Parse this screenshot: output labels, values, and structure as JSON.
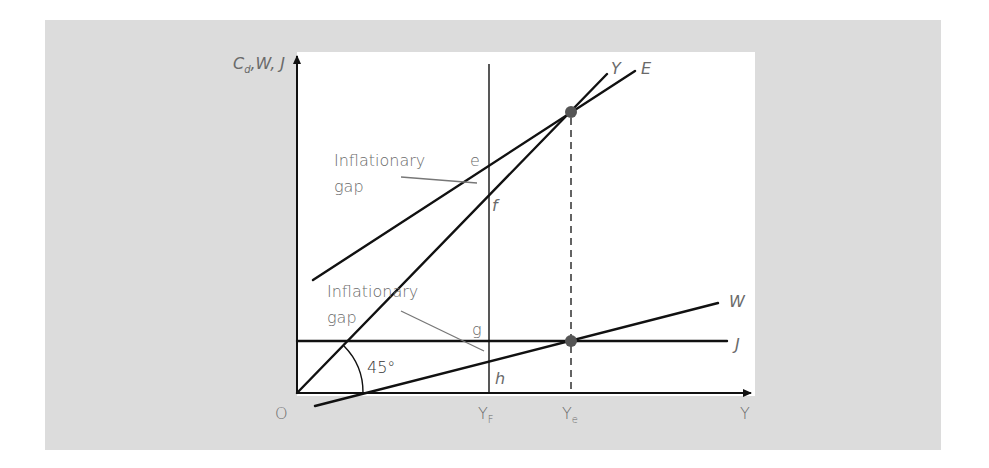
{
  "diagram": {
    "type": "keynesian-cross-inflationary-gap",
    "axes": {
      "y_label_main": "C",
      "y_label_sub": "d",
      "y_label_rest": ",W, J",
      "x_label": "Y",
      "origin_label": "O"
    },
    "lines": [
      {
        "id": "Y",
        "label": "Y",
        "description": "45° line (Y = Cd)"
      },
      {
        "id": "E",
        "label": "E",
        "description": "Aggregate expenditure"
      },
      {
        "id": "W",
        "label": "W",
        "description": "Withdrawals"
      },
      {
        "id": "J",
        "label": "J",
        "description": "Injections"
      }
    ],
    "x_markers": [
      {
        "main": "Y",
        "sub": "F",
        "description": "Full-employment income"
      },
      {
        "main": "Y",
        "sub": "e",
        "description": "Equilibrium income"
      }
    ],
    "points": {
      "e": "e",
      "f": "f",
      "g": "g",
      "h": "h"
    },
    "annotations": {
      "upper_gap_line1": "Inflationary",
      "upper_gap_line2": "gap",
      "lower_gap_line1": "Inflationary",
      "lower_gap_line2": "gap",
      "angle": "45°"
    },
    "colors": {
      "panel": "#dcdcdc",
      "plot": "#ffffff",
      "lines": "#111111",
      "labels": "#6a6a6a",
      "equilibrium_dot": "#555555"
    }
  }
}
